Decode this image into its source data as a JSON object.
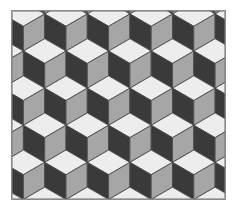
{
  "figure": {
    "background_color": "#ffffff",
    "border_color": "#8a8a8a",
    "border_width": 1,
    "frame": {
      "x": 11,
      "y": 10,
      "width": 215,
      "height": 190
    }
  },
  "chart_data": {
    "type": "diagram",
    "pattern": "rhombille-tiling",
    "cube": {
      "width": 43,
      "height": 50,
      "half_width": 21.5,
      "quarter_height": 12.5,
      "faces": [
        {
          "name": "top",
          "color": "#ededed",
          "label": "light top face"
        },
        {
          "name": "left",
          "color": "#3a3a3a",
          "label": "dark left face"
        },
        {
          "name": "right",
          "color": "#a6a6a6",
          "label": "gray right face"
        }
      ]
    },
    "lattice": {
      "columns": 6,
      "rows": 6,
      "column_step_x": 43,
      "row_step_y": 37.5,
      "row_offset_x": 21.5,
      "origin_x": -10,
      "origin_y": -22
    },
    "outline": {
      "color": "#4a4a4a",
      "width": 0.9
    },
    "colors": {
      "light": "#ededed",
      "gray": "#a6a6a6",
      "dark": "#3a3a3a",
      "outline": "#4a4a4a",
      "border": "#8a8a8a",
      "background": "#ffffff"
    }
  }
}
